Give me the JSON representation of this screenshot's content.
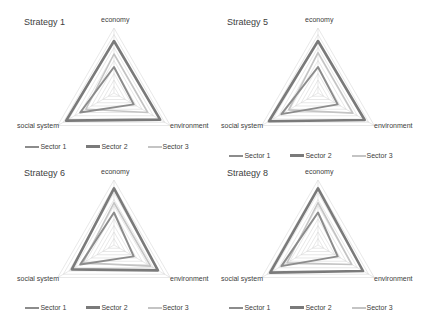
{
  "chart_data": [
    {
      "type": "radar",
      "title": "Strategy 1",
      "axes": [
        "economy",
        "environment",
        "social system"
      ],
      "rmax": 10,
      "grid_levels": 10,
      "series": [
        {
          "name": "Sector 1",
          "values": [
            4.0,
            3.5,
            6.0
          ]
        },
        {
          "name": "Sector 2",
          "values": [
            8.0,
            8.2,
            8.5
          ]
        },
        {
          "name": "Sector 3",
          "values": [
            6.0,
            6.0,
            5.0
          ]
        }
      ],
      "legend": [
        "Sector 1",
        "Sector 2",
        "Sector 3"
      ],
      "legend_position": "bottom"
    },
    {
      "type": "radar",
      "title": "Strategy 5",
      "axes": [
        "economy",
        "environment",
        "social system"
      ],
      "rmax": 10,
      "grid_levels": 10,
      "series": [
        {
          "name": "Sector 1",
          "values": [
            4.0,
            3.5,
            6.5
          ]
        },
        {
          "name": "Sector 2",
          "values": [
            8.0,
            8.3,
            8.7
          ]
        },
        {
          "name": "Sector 3",
          "values": [
            6.2,
            6.2,
            5.2
          ]
        }
      ],
      "legend": [
        "Sector 1",
        "Sector 2",
        "Sector 3"
      ],
      "legend_position": "bottom"
    },
    {
      "type": "radar",
      "title": "Strategy 6",
      "axes": [
        "economy",
        "environment",
        "social system"
      ],
      "rmax": 10,
      "grid_levels": 10,
      "series": [
        {
          "name": "Sector 1",
          "values": [
            5.0,
            3.5,
            6.0
          ]
        },
        {
          "name": "Sector 2",
          "values": [
            8.7,
            7.8,
            7.5
          ]
        },
        {
          "name": "Sector 3",
          "values": [
            6.5,
            6.5,
            5.5
          ]
        }
      ],
      "legend": [
        "Sector 1",
        "Sector 2",
        "Sector 3"
      ],
      "legend_position": "bottom"
    },
    {
      "type": "radar",
      "title": "Strategy 8",
      "axes": [
        "economy",
        "environment",
        "social system"
      ],
      "rmax": 10,
      "grid_levels": 10,
      "series": [
        {
          "name": "Sector 1",
          "values": [
            5.0,
            3.5,
            6.5
          ]
        },
        {
          "name": "Sector 2",
          "values": [
            8.7,
            8.0,
            8.5
          ]
        },
        {
          "name": "Sector 3",
          "values": [
            6.5,
            6.0,
            5.5
          ]
        }
      ],
      "legend": [
        "Sector 1",
        "Sector 2",
        "Sector 3"
      ],
      "legend_position": "bottom"
    }
  ],
  "colors": {
    "sector1": "#8c8c8c",
    "sector2": "#7a7a7a",
    "sector3": "#c4c4c4",
    "grid": "#d9d9d9",
    "text": "#404040"
  },
  "panels": [
    {
      "title": "Strategy 1",
      "axis_top": "economy",
      "axis_right": "environment",
      "axis_left": "social system",
      "legend": {
        "s1": "Sector 1",
        "s2": "Sector 2",
        "s3": "Sector 3"
      }
    },
    {
      "title": "Strategy 5",
      "axis_top": "economy",
      "axis_right": "environment",
      "axis_left": "social system",
      "legend": {
        "s1": "Sector 1",
        "s2": "Sector 2",
        "s3": "Sector 3"
      }
    },
    {
      "title": "Strategy 6",
      "axis_top": "economy",
      "axis_right": "environment",
      "axis_left": "social system",
      "legend": {
        "s1": "Sector 1",
        "s2": "Sector 2",
        "s3": "Sector 3"
      }
    },
    {
      "title": "Strategy 8",
      "axis_top": "economy",
      "axis_right": "environment",
      "axis_left": "social system",
      "legend": {
        "s1": "Sector 1",
        "s2": "Sector 2",
        "s3": "Sector 3"
      }
    }
  ]
}
